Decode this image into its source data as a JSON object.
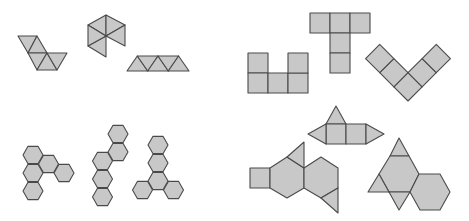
{
  "colors": {
    "fill": "#c8c8c8",
    "stroke": "#4a4a4a",
    "background": "#ffffff"
  },
  "nets": [
    {
      "name": "triangle-strip-zigzag-net",
      "shape": "triangles",
      "count": 5
    },
    {
      "name": "hexagon-fan-triangles-net",
      "shape": "triangles",
      "count": 5
    },
    {
      "name": "triangle-row-net",
      "shape": "triangles",
      "count": 5
    },
    {
      "name": "hexagon-cluster-net-a",
      "shape": "hexagons",
      "count": 5
    },
    {
      "name": "hexagon-chain-net-b",
      "shape": "hexagons",
      "count": 5
    },
    {
      "name": "hexagon-tripod-net-c",
      "shape": "hexagons",
      "count": 5
    },
    {
      "name": "u-shaped-square-net",
      "shape": "squares",
      "count": 5
    },
    {
      "name": "t-shaped-square-net",
      "shape": "squares",
      "count": 5
    },
    {
      "name": "v-shaped-square-net",
      "shape": "squares",
      "count": 5
    },
    {
      "name": "triangular-prism-net",
      "shape": "squares+triangles",
      "count": 5
    },
    {
      "name": "square-hexagon-triangle-net",
      "shape": "mixed",
      "count": 5
    },
    {
      "name": "truncated-tetrahedron-net",
      "shape": "mixed",
      "count": 6
    }
  ]
}
